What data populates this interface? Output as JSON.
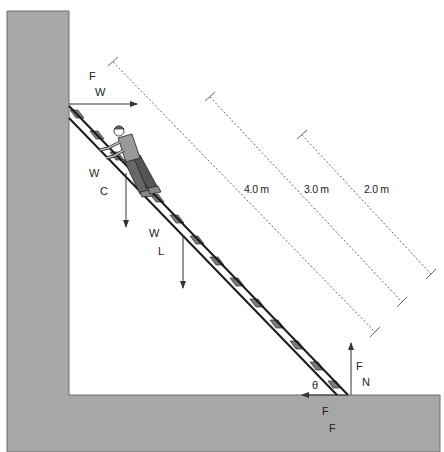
{
  "colors": {
    "wall_fill": "#a7a7a7",
    "wall_stroke": "#6e6e6e",
    "ladder_rail": "#1a1a1a",
    "ladder_rung": "#7a7a7a",
    "arrow": "#333333",
    "dimension_line": "#666666",
    "text": "#222222"
  },
  "forces": {
    "wall_force": {
      "symbol": "F",
      "subscript": "W"
    },
    "climber_weight": {
      "symbol": "W",
      "subscript": "C"
    },
    "ladder_weight": {
      "symbol": "W",
      "subscript": "L"
    },
    "normal_force": {
      "symbol": "F",
      "subscript": "N"
    },
    "friction_force": {
      "symbol": "F",
      "subscript": "F"
    }
  },
  "angle": {
    "symbol": "θ"
  },
  "dimensions": [
    {
      "label": "4.0 m"
    },
    {
      "label": "3.0 m"
    },
    {
      "label": "2.0 m"
    }
  ]
}
